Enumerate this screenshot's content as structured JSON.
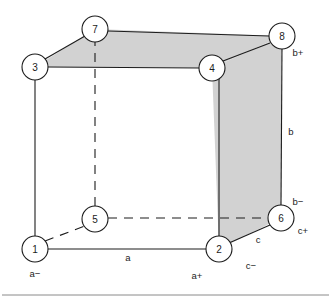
{
  "diagram": {
    "colors": {
      "face_shade": "#d2d2d2",
      "stroke": "#1c1c1c",
      "background": "#ffffff",
      "rule": "#8a8a8a"
    },
    "nodes": [
      {
        "id": "n1",
        "label": "1",
        "cx": 35,
        "cy": 249,
        "r": 13
      },
      {
        "id": "n2",
        "label": "2",
        "cx": 219,
        "cy": 249,
        "r": 13
      },
      {
        "id": "n3",
        "label": "3",
        "cx": 35,
        "cy": 67,
        "r": 13
      },
      {
        "id": "n4",
        "label": "4",
        "cx": 212,
        "cy": 68,
        "r": 13
      },
      {
        "id": "n5",
        "label": "5",
        "cx": 95,
        "cy": 219,
        "r": 13
      },
      {
        "id": "n6",
        "label": "6",
        "cx": 281,
        "cy": 218,
        "r": 13
      },
      {
        "id": "n7",
        "label": "7",
        "cx": 95,
        "cy": 29,
        "r": 13
      },
      {
        "id": "n8",
        "label": "8",
        "cx": 282,
        "cy": 36,
        "r": 13
      }
    ],
    "faces": [
      {
        "name": "top-face",
        "points": "35,67 95,29 282,36 212,68"
      },
      {
        "name": "right-face",
        "points": "212,68 282,36 281,218 219,249"
      }
    ],
    "edges": [
      {
        "name": "edge-1-2",
        "style": "solid",
        "x1": 48,
        "y1": 249,
        "x2": 206,
        "y2": 249
      },
      {
        "name": "edge-1-3",
        "style": "solid",
        "x1": 35,
        "y1": 236,
        "x2": 35,
        "y2": 80
      },
      {
        "name": "edge-1-5",
        "style": "dashed",
        "x1": 45,
        "y1": 241,
        "x2": 85,
        "y2": 226
      },
      {
        "name": "edge-2-4",
        "style": "solid",
        "x1": 219,
        "y1": 236,
        "x2": 219,
        "y2": 79
      },
      {
        "name": "edge-2-6",
        "style": "solid",
        "x1": 229,
        "y1": 243,
        "x2": 270,
        "y2": 225
      },
      {
        "name": "edge-3-4",
        "style": "solid",
        "x1": 48,
        "y1": 67,
        "x2": 199,
        "y2": 68
      },
      {
        "name": "edge-3-7",
        "style": "solid",
        "x1": 45,
        "y1": 59,
        "x2": 85,
        "y2": 36
      },
      {
        "name": "edge-4-8",
        "style": "solid",
        "x1": 223,
        "y1": 61,
        "x2": 270,
        "y2": 43
      },
      {
        "name": "edge-5-6",
        "style": "dashed",
        "x1": 108,
        "y1": 218,
        "x2": 268,
        "y2": 218
      },
      {
        "name": "edge-5-7",
        "style": "dashed",
        "x1": 95,
        "y1": 206,
        "x2": 95,
        "y2": 42
      },
      {
        "name": "edge-7-8",
        "style": "solid",
        "x1": 108,
        "y1": 31,
        "x2": 269,
        "y2": 36
      },
      {
        "name": "edge-6-8",
        "style": "solid",
        "x1": 281,
        "y1": 205,
        "x2": 282,
        "y2": 49
      }
    ],
    "edge_labels": [
      {
        "name": "label-a",
        "text": "a",
        "x": 128,
        "y": 257
      },
      {
        "name": "label-b",
        "text": "b",
        "x": 291,
        "y": 131
      },
      {
        "name": "label-c",
        "text": "c",
        "x": 258,
        "y": 239
      },
      {
        "name": "label-a-minus",
        "text": "a−",
        "x": 35,
        "y": 273
      },
      {
        "name": "label-a-plus",
        "text": "a+",
        "x": 197,
        "y": 275
      },
      {
        "name": "label-b-plus",
        "text": "b+",
        "x": 298,
        "y": 52
      },
      {
        "name": "label-b-minus",
        "text": "b−",
        "x": 298,
        "y": 201
      },
      {
        "name": "label-c-plus",
        "text": "c+",
        "x": 303,
        "y": 230
      },
      {
        "name": "label-c-minus",
        "text": "c−",
        "x": 251,
        "y": 265
      }
    ],
    "rule": {
      "name": "bottom-rule",
      "x1": 2,
      "y1": 295,
      "x2": 329,
      "y2": 295
    }
  }
}
